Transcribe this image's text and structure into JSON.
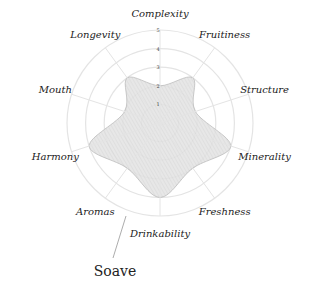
{
  "chart_data": {
    "type": "radar",
    "title": "Soave",
    "axes": [
      "Complexity",
      "Fruitiness",
      "Structure",
      "Minerality",
      "Freshness",
      "Drinkability",
      "Aromas",
      "Harmony",
      "Mouth",
      "Longevity"
    ],
    "series": [
      {
        "name": "Soave",
        "values": [
          2,
          3,
          2,
          4,
          3,
          4,
          3,
          4,
          2,
          3
        ]
      }
    ],
    "radial_ticks": [
      "1",
      "2",
      "3",
      "4",
      "5"
    ],
    "rlim": [
      0,
      5
    ],
    "grid": true,
    "legend": "none"
  },
  "colors": {
    "fill": "#dcdcdc",
    "stroke": "#bdbdbd",
    "grid": "#e4e4e4",
    "text": "#222222"
  }
}
